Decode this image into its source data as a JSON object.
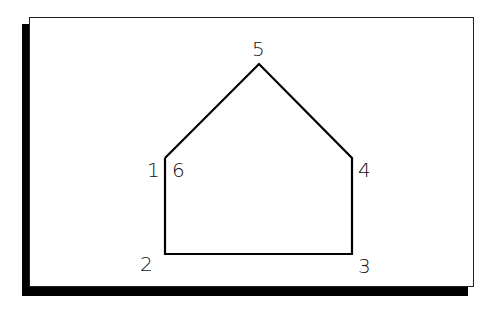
{
  "diagram": {
    "type": "polygon-vertex-labels",
    "stroke_color": "#000000",
    "background": "#ffffff",
    "frame": {
      "shadow_color": "#000000"
    },
    "vertices": [
      {
        "label": "1",
        "x": 165,
        "y": 158
      },
      {
        "label": "2",
        "x": 165,
        "y": 254
      },
      {
        "label": "3",
        "x": 352,
        "y": 254
      },
      {
        "label": "4",
        "x": 352,
        "y": 158
      },
      {
        "label": "5",
        "x": 259,
        "y": 64
      },
      {
        "label": "6",
        "x": 165,
        "y": 158
      }
    ],
    "labels": [
      {
        "text": "1",
        "x": 147,
        "y": 177
      },
      {
        "text": "6",
        "x": 176,
        "y": 177
      },
      {
        "text": "5",
        "x": 252,
        "y": 56
      },
      {
        "text": "4",
        "x": 358,
        "y": 177
      },
      {
        "text": "2",
        "x": 140,
        "y": 271
      },
      {
        "text": "3",
        "x": 358,
        "y": 273
      }
    ]
  }
}
